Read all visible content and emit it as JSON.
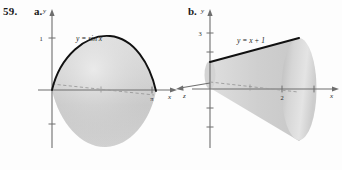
{
  "exercise": {
    "number": "59.",
    "parts": [
      {
        "key": "a",
        "label": "a.",
        "curve_equation": "y = sin x",
        "y_axis_label": "y",
        "x_axis_label": "x",
        "y_ticks": [
          "1"
        ],
        "x_ticks": [
          "π"
        ],
        "solid_type": "solid-of-revolution-sine",
        "fill_color": "#cfcfcf",
        "curve_color": "#111111"
      },
      {
        "key": "b",
        "label": "b.",
        "curve_equation": "y = x + 1",
        "y_axis_label": "y",
        "x_axis_label": "x",
        "y_ticks": [
          "3"
        ],
        "x_ticks": [
          "2"
        ],
        "solid_type": "cone",
        "fill_color": "#cfcfcf",
        "curve_color": "#111111"
      }
    ]
  },
  "colors": {
    "page_background": "#fdfdfd",
    "axis": "#6e6e6e",
    "solid_light": "#e2e2e2",
    "solid_mid": "#cccccc",
    "solid_dark": "#b4b4b4",
    "curve": "#111111",
    "dashed_axis": "#9a9a9a"
  }
}
